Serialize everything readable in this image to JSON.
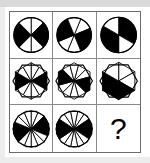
{
  "puzzle": {
    "type": "progressive-matrix",
    "title": "Sectored figure matrix",
    "rows": 3,
    "columns": 3,
    "missing_cell": "row-3-col-3",
    "missing_marker": "?",
    "colors": {
      "fill_dark": "#000000",
      "fill_light": "#ffffff",
      "stroke": "#000000",
      "grid_line": "#8a8a8a",
      "frame": "#6b6b6b",
      "background": "#ffffff",
      "scan_band": "#d9d9d9"
    },
    "cells": [
      {
        "id": "row-1-col-1",
        "name": "circle-8-sectors-a",
        "shape": "circle",
        "sectors": 8,
        "rotation": 0,
        "radius": 18,
        "dark_sectors": [
          1,
          2,
          5,
          6
        ]
      },
      {
        "id": "row-1-col-2",
        "name": "circle-8-sectors-b",
        "shape": "circle",
        "sectors": 8,
        "rotation": 22.5,
        "radius": 18,
        "dark_sectors": [
          1,
          2,
          5,
          6
        ]
      },
      {
        "id": "row-1-col-3",
        "name": "circle-6-sectors",
        "shape": "circle",
        "sectors": 6,
        "rotation": 0,
        "radius": 18,
        "dark_sectors": [
          0,
          1,
          3,
          4
        ]
      },
      {
        "id": "row-2-col-1",
        "name": "hexagon-12-sectors-a",
        "shape": "hexagon",
        "sectors": 12,
        "rotation": 0,
        "radius": 19,
        "dark_sectors": [
          2,
          3,
          8,
          9
        ]
      },
      {
        "id": "row-2-col-2",
        "name": "hexagon-12-sectors-b",
        "shape": "hexagon",
        "sectors": 12,
        "rotation": 15,
        "radius": 19,
        "dark_sectors": [
          2,
          3,
          8,
          9
        ]
      },
      {
        "id": "row-2-col-3",
        "name": "hexagon-6-sectors",
        "shape": "hexagon",
        "sectors": 6,
        "rotation": 0,
        "radius": 19,
        "dark_sectors": [
          2,
          3,
          4
        ]
      },
      {
        "id": "row-3-col-1",
        "name": "dodecagon-16-sectors-a",
        "shape": "dodecagon",
        "sectors": 16,
        "rotation": 0,
        "radius": 19,
        "dark_sectors": [
          2,
          3,
          4,
          10,
          11,
          12
        ]
      },
      {
        "id": "row-3-col-2",
        "name": "dodecagon-16-sectors-b",
        "shape": "dodecagon",
        "sectors": 16,
        "rotation": 11.25,
        "radius": 19,
        "dark_sectors": [
          2,
          3,
          4,
          10,
          11,
          12
        ]
      },
      {
        "id": "row-3-col-3",
        "name": "answer-placeholder",
        "shape": "question-mark",
        "sectors": 0,
        "rotation": 0,
        "radius": 0,
        "dark_sectors": []
      }
    ]
  }
}
